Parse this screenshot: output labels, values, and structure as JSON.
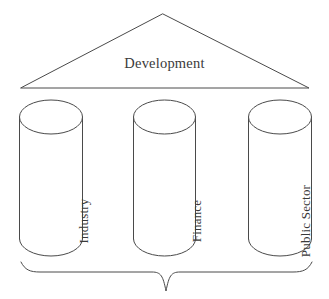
{
  "diagram": {
    "kind": "temple-pillars-diagram",
    "roof": {
      "shape": "triangle-pediment",
      "label": "Development",
      "apex": {
        "x": 163,
        "y": 14
      },
      "base_left": {
        "x": 21,
        "y": 88
      },
      "base_right": {
        "x": 309,
        "y": 88
      }
    },
    "pillars": [
      {
        "name": "pillar-industry",
        "label": "Industry",
        "orientation": "vertical-bottom-to-top",
        "shape": "cylinder",
        "x": 19,
        "width": 64,
        "top": 100,
        "bottom": 256,
        "cap_height": 34
      },
      {
        "name": "pillar-finance",
        "label": "Finance",
        "orientation": "vertical-bottom-to-top",
        "shape": "cylinder",
        "x": 133,
        "width": 63,
        "top": 100,
        "bottom": 256,
        "cap_height": 34
      },
      {
        "name": "pillar-public-sector",
        "label": "Public Sector",
        "orientation": "vertical-bottom-to-top",
        "shape": "cylinder",
        "x": 248,
        "width": 64,
        "top": 100,
        "bottom": 256,
        "cap_height": 34
      }
    ],
    "base_brace": {
      "shape": "curly-brace-down",
      "label": "",
      "left": {
        "x": 21,
        "y": 262
      },
      "right": {
        "x": 312,
        "y": 262
      },
      "center": {
        "x": 166,
        "y": 291
      }
    },
    "colors": {
      "stroke": "#4a4a4a",
      "text": "#3a3a3a",
      "fill": "#ffffff",
      "background": "#ffffff"
    }
  }
}
